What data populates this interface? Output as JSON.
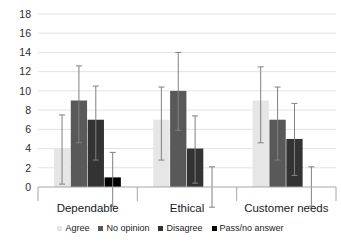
{
  "chart_data": {
    "type": "bar",
    "title": "",
    "subtitle": "",
    "xlabel": "",
    "ylabel": "",
    "ylim": [
      0,
      18
    ],
    "ytick_step": 2,
    "yticks": [
      0,
      2,
      4,
      6,
      8,
      10,
      12,
      14,
      16,
      18
    ],
    "ytick_labels": [
      "0",
      "2",
      "4",
      "6",
      "8",
      "10",
      "12",
      "14",
      "16",
      "18"
    ],
    "grid": true,
    "grid_axis": "y",
    "legend_position": "bottom",
    "error_bars": true,
    "categories": [
      "Dependable",
      "Ethical",
      "Customer needs"
    ],
    "series": [
      {
        "name": "Agree",
        "color": "#e6e6e6",
        "values": [
          4,
          7,
          9
        ],
        "err_low": [
          0.3,
          2.8,
          4.6
        ],
        "err_high": [
          7.5,
          10.4,
          12.5
        ]
      },
      {
        "name": "No opinion",
        "color": "#595959",
        "values": [
          9,
          10,
          7
        ],
        "err_low": [
          4.6,
          5.9,
          2.8
        ],
        "err_high": [
          12.6,
          14.0,
          10.4
        ]
      },
      {
        "name": "Disagree",
        "color": "#333333",
        "values": [
          7,
          4,
          5
        ],
        "err_low": [
          2.8,
          0.4,
          1.2
        ],
        "err_high": [
          10.5,
          7.4,
          8.7
        ]
      },
      {
        "name": "Pass/no answer",
        "color": "#000000",
        "values": [
          1,
          0,
          0
        ],
        "err_low": [
          -2.0,
          -2.1,
          -2.0
        ],
        "err_high": [
          3.6,
          2.1,
          2.1
        ]
      }
    ],
    "axis_color": "#a6a6a6",
    "grid_color": "#e3e3e3",
    "errorbar_color": "#808080",
    "tick_label_color": "#2b2b2b"
  },
  "legend": {
    "items": [
      {
        "label": "Agree"
      },
      {
        "label": "No opinion"
      },
      {
        "label": "Disagree"
      },
      {
        "label": "Pass/no answer"
      }
    ]
  }
}
